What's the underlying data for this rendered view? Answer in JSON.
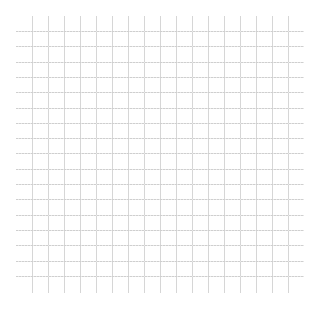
{
  "grid": {
    "background": "#ffffff",
    "line_color": "#d2d2d2",
    "vertical": {
      "count": 17,
      "x_start": 32,
      "spacing": 16,
      "y_top": 16,
      "y_bottom": 293
    },
    "horizontal": {
      "count": 17,
      "y_start": 31,
      "spacing": 15.3,
      "x_left": 16,
      "x_right": 304
    }
  }
}
